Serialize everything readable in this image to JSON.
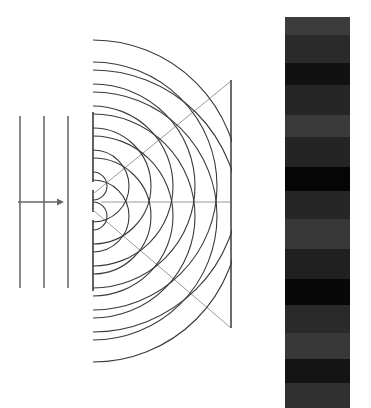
{
  "colors": {
    "background": "#ffffff",
    "line": "#3a3a3a",
    "guide": "#9a9a9a",
    "arrow": "#666666"
  },
  "incident_wave": {
    "wavefront_x": [
      20,
      44,
      68
    ],
    "y_top": 116,
    "y_bottom": 288,
    "arrow": {
      "x1": 18,
      "x2": 64,
      "y": 202
    }
  },
  "barrier": {
    "x": 93,
    "y_top": 112,
    "y_bottom": 291,
    "slits_y": [
      186,
      216
    ]
  },
  "sources": [
    {
      "x": 93,
      "y": 186
    },
    {
      "x": 93,
      "y": 216
    }
  ],
  "arc_radii": [
    14,
    36,
    58,
    80,
    102,
    124,
    146
  ],
  "screen": {
    "x": 231,
    "y_top": 80,
    "y_bottom": 328
  },
  "guides": [
    {
      "x1": 93,
      "y1": 194,
      "x2": 231,
      "y2": 81
    },
    {
      "x1": 101,
      "y1": 202,
      "x2": 231,
      "y2": 202
    },
    {
      "x1": 93,
      "y1": 210,
      "x2": 231,
      "y2": 328
    }
  ],
  "pattern": {
    "label": "interference-fringes",
    "bands": [
      {
        "h": 18,
        "color": "#3c3c3c"
      },
      {
        "h": 28,
        "color": "#2a2a2a"
      },
      {
        "h": 22,
        "color": "#111111"
      },
      {
        "h": 30,
        "color": "#262626"
      },
      {
        "h": 22,
        "color": "#3a3a3a"
      },
      {
        "h": 30,
        "color": "#242424"
      },
      {
        "h": 24,
        "color": "#050505"
      },
      {
        "h": 28,
        "color": "#262626"
      },
      {
        "h": 30,
        "color": "#383838"
      },
      {
        "h": 30,
        "color": "#202020"
      },
      {
        "h": 26,
        "color": "#080808"
      },
      {
        "h": 28,
        "color": "#2a2a2a"
      },
      {
        "h": 26,
        "color": "#383838"
      },
      {
        "h": 24,
        "color": "#141414"
      },
      {
        "h": 25,
        "color": "#303030"
      }
    ]
  }
}
